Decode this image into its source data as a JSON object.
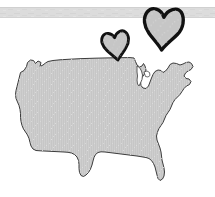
{
  "scene": {
    "title": "United States map illustration with two hand-drawn hearts",
    "width": 215,
    "height": 197,
    "background_color": "#ffffff"
  },
  "banner": {
    "name": "top-gray-band",
    "color": "#dcdcdc",
    "edge_color": "#d0d0d0",
    "x": 0,
    "y": 7,
    "width": 215,
    "height": 11
  },
  "map": {
    "name": "united-states-map",
    "label": "United States",
    "fill_color": "#c6c6c6",
    "texture_color": "#d2d2d2",
    "outline_color": "#3c3c3c",
    "outline_width": 1,
    "bounds": {
      "x": 15,
      "y": 57,
      "width": 180,
      "height": 127
    }
  },
  "hearts": [
    {
      "name": "heart-small",
      "label": "Small hand-drawn heart",
      "fill_color": "#c6c6c6",
      "outline_color": "#111111",
      "outline_width": 3,
      "cx": 116,
      "cy": 47,
      "scale": 0.78,
      "rotation": -8
    },
    {
      "name": "heart-large",
      "label": "Large hand-drawn heart",
      "fill_color": "#c6c6c6",
      "outline_color": "#111111",
      "outline_width": 3.4,
      "cx": 163,
      "cy": 30,
      "scale": 1.06,
      "rotation": 4
    }
  ]
}
